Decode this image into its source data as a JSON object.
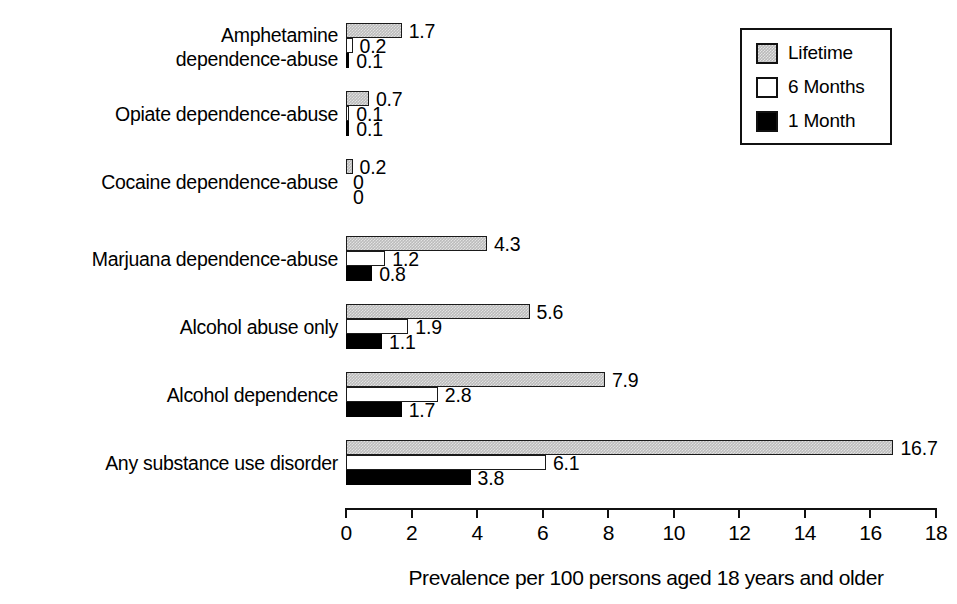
{
  "chart_data": {
    "type": "bar",
    "orientation": "horizontal",
    "grouped": true,
    "title": "",
    "xlabel": "Prevalence per 100 persons aged 18 years and older",
    "ylabel": "",
    "xlim": [
      0,
      18
    ],
    "xticks": [
      0,
      2,
      4,
      6,
      8,
      10,
      12,
      14,
      16,
      18
    ],
    "xtick_labels": [
      "0",
      "2",
      "4",
      "6",
      "8",
      "10",
      "12",
      "14",
      "16",
      "18"
    ],
    "grid": false,
    "legend_position": "top-right",
    "categories": [
      "Amphetamine dependence-abuse",
      "Opiate dependence-abuse",
      "Cocaine dependence-abuse",
      "Marjuana dependence-abuse",
      "Alcohol abuse only",
      "Alcohol dependence",
      "Any substance use disorder"
    ],
    "category_lines": [
      [
        "Amphetamine",
        "dependence-abuse"
      ],
      [
        "Opiate dependence-abuse"
      ],
      [
        "Cocaine dependence-abuse"
      ],
      [
        "Marjuana dependence-abuse"
      ],
      [
        "Alcohol abuse only"
      ],
      [
        "Alcohol dependence"
      ],
      [
        "Any substance use disorder"
      ]
    ],
    "series": [
      {
        "name": "Lifetime",
        "color": "#bcbcbc",
        "values": [
          1.7,
          0.7,
          0.2,
          4.3,
          5.6,
          7.9,
          16.7
        ],
        "labels": [
          "1.7",
          "0.7",
          "0.2",
          "4.3",
          "5.6",
          "7.9",
          "16.7"
        ]
      },
      {
        "name": "6 Months",
        "color": "#ffffff",
        "values": [
          0.2,
          0.1,
          0,
          1.2,
          1.9,
          2.8,
          6.1
        ],
        "labels": [
          "0.2",
          "0.1",
          "0",
          "1.2",
          "1.9",
          "2.8",
          "6.1"
        ]
      },
      {
        "name": "1 Month",
        "color": "#000000",
        "values": [
          0.1,
          0.1,
          0,
          0.8,
          1.1,
          1.7,
          3.8
        ],
        "labels": [
          "0.1",
          "0.1",
          "0",
          "0.8",
          "1.1",
          "1.7",
          "3.8"
        ]
      }
    ]
  },
  "legend": {
    "items": [
      {
        "label": "Lifetime",
        "swatch": "gray-hatched-swatch"
      },
      {
        "label": "6 Months",
        "swatch": "white-swatch"
      },
      {
        "label": "1 Month",
        "swatch": "black-swatch"
      }
    ]
  },
  "axis": {
    "title": "Prevalence per 100 persons aged 18 years and older",
    "ticks": [
      "0",
      "2",
      "4",
      "6",
      "8",
      "10",
      "12",
      "14",
      "16",
      "18"
    ]
  },
  "colors": {
    "lifetime": "#bcbcbc",
    "six_months": "#ffffff",
    "one_month": "#000000",
    "outline": "#111111",
    "background": "#ffffff"
  }
}
